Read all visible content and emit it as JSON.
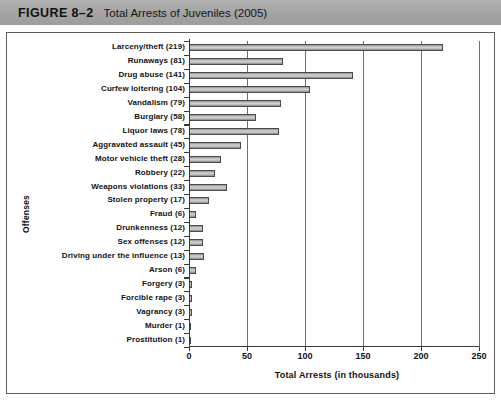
{
  "header": {
    "figure_number": "FIGURE 8–2",
    "title": "Total Arrests of Juveniles (2005)"
  },
  "chart_data": {
    "type": "bar",
    "orientation": "horizontal",
    "title": "Total Arrests of Juveniles (2005)",
    "xlabel": "Total Arrests (in thousands)",
    "ylabel": "Offenses",
    "xlim": [
      0,
      250
    ],
    "xticks": [
      0,
      50,
      100,
      150,
      200,
      250
    ],
    "xtick_labels": [
      "0",
      "50",
      "100",
      "150",
      "200",
      "250"
    ],
    "grid": true,
    "legend": null,
    "categories": [
      "Larceny/theft (219)",
      "Runaways (81)",
      "Drug abuse (141)",
      "Curfew loitering (104)",
      "Vandalism (79)",
      "Burglary (58)",
      "Liquor laws (78)",
      "Aggravated assault (45)",
      "Motor vehicle theft (28)",
      "Robbery (22)",
      "Weapons violations (33)",
      "Stolen property (17)",
      "Fraud (6)",
      "Drunkenness (12)",
      "Sex offenses (12)",
      "Driving under the influence (13)",
      "Arson (6)",
      "Forgery (3)",
      "Forcible rape (3)",
      "Vagrancy (3)",
      "Murder (1)",
      "Prostitution (1)"
    ],
    "values": [
      219,
      81,
      141,
      104,
      79,
      58,
      78,
      45,
      28,
      22,
      33,
      17,
      6,
      12,
      12,
      13,
      6,
      3,
      3,
      3,
      1,
      1
    ],
    "bar_color": "#c9c9c9",
    "bar_edge_color": "#4a4a4a"
  }
}
